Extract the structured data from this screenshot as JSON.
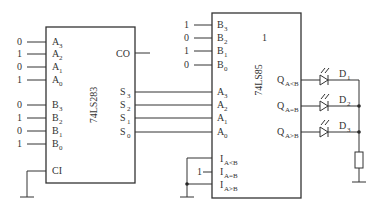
{
  "adder": {
    "name": "74LS283",
    "inputs_A": [
      {
        "label": "A",
        "sub": "3",
        "value": "0"
      },
      {
        "label": "A",
        "sub": "2",
        "value": "1"
      },
      {
        "label": "A",
        "sub": "1",
        "value": "0"
      },
      {
        "label": "A",
        "sub": "0",
        "value": "1"
      }
    ],
    "inputs_B": [
      {
        "label": "B",
        "sub": "3",
        "value": "0"
      },
      {
        "label": "B",
        "sub": "2",
        "value": "1"
      },
      {
        "label": "B",
        "sub": "1",
        "value": "0"
      },
      {
        "label": "B",
        "sub": "0",
        "value": "1"
      }
    ],
    "carry_in": "CI",
    "carry_out": "CO",
    "outputs": [
      {
        "label": "S",
        "sub": "3"
      },
      {
        "label": "S",
        "sub": "2"
      },
      {
        "label": "S",
        "sub": "1"
      },
      {
        "label": "S",
        "sub": "0"
      }
    ]
  },
  "comparator": {
    "name": "74LS85",
    "marker": "1",
    "inputs_B": [
      {
        "label": "B",
        "sub": "3",
        "value": "1"
      },
      {
        "label": "B",
        "sub": "2",
        "value": "0"
      },
      {
        "label": "B",
        "sub": "1",
        "value": "1"
      },
      {
        "label": "B",
        "sub": "0",
        "value": "0"
      }
    ],
    "inputs_A": [
      {
        "label": "A",
        "sub": "3"
      },
      {
        "label": "A",
        "sub": "2"
      },
      {
        "label": "A",
        "sub": "1"
      },
      {
        "label": "A",
        "sub": "0"
      }
    ],
    "cascade": [
      {
        "label": "I",
        "sub": "A<B"
      },
      {
        "label": "I",
        "sub": "A=B",
        "value": "1"
      },
      {
        "label": "I",
        "sub": "A>B"
      }
    ],
    "outputs": [
      {
        "label": "Q",
        "sub": "A<B"
      },
      {
        "label": "Q",
        "sub": "A=B"
      },
      {
        "label": "Q",
        "sub": "A>B"
      }
    ]
  },
  "leds": [
    {
      "label": "D",
      "sub": "1"
    },
    {
      "label": "D",
      "sub": "2"
    },
    {
      "label": "D",
      "sub": "3"
    }
  ]
}
